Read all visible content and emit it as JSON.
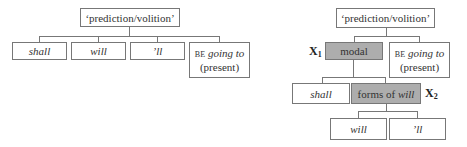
{
  "left_tree": {
    "root": "‘prediction/volition’",
    "children": [
      {
        "label": "shall",
        "italic": true
      },
      {
        "label": "will",
        "italic": true
      },
      {
        "label": "’ll",
        "italic": true
      },
      {
        "prefix": "BE",
        "label": "going to",
        "suffix": "(present)"
      }
    ]
  },
  "right_tree": {
    "root": "‘prediction/volition’",
    "modal": {
      "label": "modal",
      "marker": "X",
      "marker_sub": "1"
    },
    "be_going_to": {
      "prefix": "BE",
      "label": "going to",
      "suffix": "(present)"
    },
    "shall": {
      "label": "shall"
    },
    "forms_of_will": {
      "label_plain": "forms of ",
      "label_italic": "will",
      "marker": "X",
      "marker_sub": "2"
    },
    "leaves": [
      {
        "label": "will"
      },
      {
        "label": "’ll"
      }
    ]
  },
  "colors": {
    "highlight_fill": "#adadad",
    "border": "#777777"
  }
}
